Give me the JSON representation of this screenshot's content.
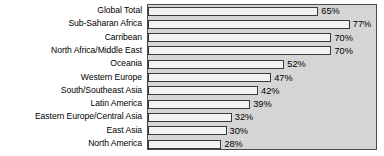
{
  "chart_data": {
    "type": "bar",
    "orientation": "horizontal",
    "title": "",
    "subtitle": "",
    "xlabel": "",
    "ylabel": "",
    "xlim": [
      0,
      87
    ],
    "grid": false,
    "legend": false,
    "value_suffix": "%",
    "categories": [
      "Global Total",
      "Sub-Saharan Africa",
      "Carribean",
      "North Africa/Middle East",
      "Oceania",
      "Western Europe",
      "South/Southeast Asia",
      "Latin America",
      "Eastern Europe/Central Asia",
      "East Asia",
      "North America"
    ],
    "values": [
      65,
      77,
      70,
      70,
      52,
      47,
      42,
      39,
      32,
      30,
      28
    ],
    "data_labels": [
      "65%",
      "77%",
      "70%",
      "70%",
      "52%",
      "47%",
      "42%",
      "39%",
      "32%",
      "30%",
      "28%"
    ],
    "colors": {
      "plot_background": "#d5d5d5",
      "page_background": "#ffffff",
      "bar_fill": "#f2f2f2",
      "bar_outline": "#3a3a3a",
      "frame": "#4a4a4a",
      "text": "#000000"
    }
  }
}
